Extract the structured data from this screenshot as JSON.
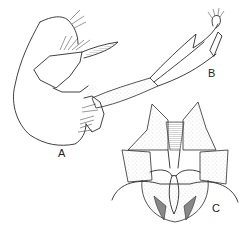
{
  "figure": {
    "labels": {
      "a": "A",
      "b": "B",
      "c": "C"
    },
    "colors": {
      "ink": "#2a2a2a",
      "background": "#ffffff",
      "shade": "#888888"
    }
  }
}
